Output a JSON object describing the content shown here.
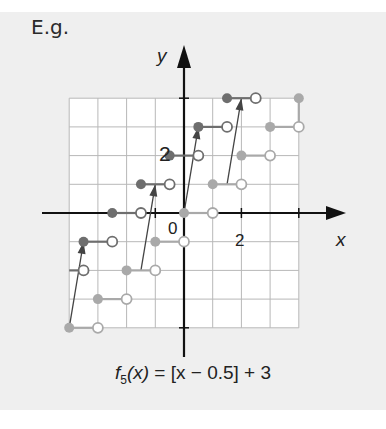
{
  "heading": "E.g.",
  "graph": {
    "x_axis_label": "x",
    "y_axis_label": "y",
    "origin_label": "0",
    "x_tick_label": "2",
    "y_tick_label": "2",
    "colors": {
      "background": "#efefef",
      "grid_fill": "#ffffff",
      "grid_line": "#b8b8b8",
      "axis": "#111111",
      "dark_series": "#6e6e6e",
      "light_series": "#a9a9a9",
      "arrow": "#444444"
    }
  },
  "caption": {
    "func": "f",
    "sub": "5",
    "arg": "(x)",
    "rest": " = [x − 0.5] + 3"
  },
  "chart_data": {
    "type": "line",
    "title": "f5(x) = [x − 0.5] + 3",
    "xlabel": "x",
    "ylabel": "y",
    "xlim": [
      -4,
      4
    ],
    "ylim": [
      -4,
      4
    ],
    "grid": true,
    "unit": 1,
    "series": [
      {
        "name": "f5 (shifted, dark)",
        "steps": [
          {
            "y": -1,
            "x_closed": -3.5,
            "x_open": -2.5
          },
          {
            "y": 0,
            "x_closed": -2.5,
            "x_open": -1.5
          },
          {
            "y": 1,
            "x_closed": -1.5,
            "x_open": -0.5
          },
          {
            "y": 2,
            "x_closed": -0.5,
            "x_open": 0.5
          },
          {
            "y": 3,
            "x_closed": 0.5,
            "x_open": 1.5
          },
          {
            "y": 4,
            "x_closed": 1.5,
            "x_open": 2.5
          }
        ]
      },
      {
        "name": "original (light)",
        "steps": [
          {
            "y": -4,
            "x_closed": -4,
            "x_open": -3
          },
          {
            "y": -3,
            "x_closed": -3,
            "x_open": -2
          },
          {
            "y": -2,
            "x_closed": -2,
            "x_open": -1
          },
          {
            "y": -1,
            "x_closed": -1,
            "x_open": 0
          },
          {
            "y": 0,
            "x_closed": 0,
            "x_open": 1
          },
          {
            "y": 1,
            "x_closed": 1,
            "x_open": 2
          },
          {
            "y": 2,
            "x_closed": 2,
            "x_open": 3
          },
          {
            "y": 3,
            "x_closed": 3,
            "x_open": 4
          },
          {
            "y": 4,
            "x_closed": 4,
            "x_open": null
          }
        ]
      }
    ],
    "extra_open_points": [
      {
        "x": -3.5,
        "y": -2
      }
    ],
    "arrows": [
      {
        "from": [
          -4,
          -4
        ],
        "to": [
          -3.5,
          -1
        ]
      },
      {
        "from": [
          -1.5,
          -2
        ],
        "to": [
          -1,
          1
        ]
      },
      {
        "from": [
          0,
          0
        ],
        "to": [
          0.5,
          3
        ]
      },
      {
        "from": [
          1.5,
          1
        ],
        "to": [
          2,
          4
        ]
      }
    ]
  }
}
